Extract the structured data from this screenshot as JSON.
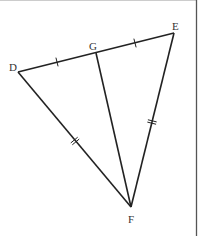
{
  "figure": {
    "type": "triangle-with-median",
    "colors": {
      "stroke": "#222222",
      "label": "#333333",
      "border": "#555555",
      "background": "#ffffff"
    },
    "points": {
      "D": {
        "label": "D",
        "x": 18,
        "y": 72,
        "lx": 9,
        "ly": 71
      },
      "E": {
        "label": "E",
        "x": 174,
        "y": 33,
        "lx": 172,
        "ly": 30
      },
      "G": {
        "label": "G",
        "x": 96,
        "y": 53,
        "lx": 89,
        "ly": 50
      },
      "F": {
        "label": "F",
        "x": 131,
        "y": 207,
        "lx": 128,
        "ly": 223
      }
    },
    "segments": [
      {
        "name": "DE",
        "from": "D",
        "to": "E"
      },
      {
        "name": "DF",
        "from": "D",
        "to": "F"
      },
      {
        "name": "EF",
        "from": "E",
        "to": "F"
      },
      {
        "name": "GF",
        "from": "G",
        "to": "F"
      }
    ],
    "tick_marks": [
      {
        "segment": "DG",
        "count": 1,
        "x": 57,
        "y": 62
      },
      {
        "segment": "GE",
        "count": 1,
        "x": 135,
        "y": 43
      },
      {
        "segment": "DF",
        "count": 2,
        "x": 75,
        "y": 141
      },
      {
        "segment": "EF",
        "count": 2,
        "x": 152,
        "y": 122
      }
    ]
  }
}
